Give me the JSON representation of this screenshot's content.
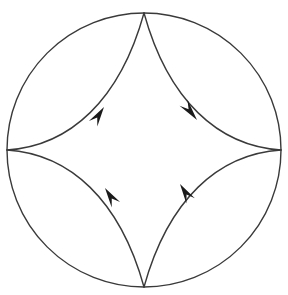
{
  "figure": {
    "background_color": "#ffffff",
    "stroke_color": "#3a3a3a",
    "arrow_color": "#1a1a1a",
    "circle_stroke_width": 1.4,
    "astroid_stroke_width": 1.4,
    "canvas": {
      "width": 288,
      "height": 295
    }
  },
  "circle": {
    "name": "boundary-circle",
    "center_x": 144,
    "center_y": 150,
    "radius": 137,
    "stroke": "#3a3a3a",
    "stroke_width": 1.4
  },
  "astroid": {
    "name": "inscribed-astroid",
    "cusps": [
      {
        "label": "top-cusp",
        "x": 144,
        "y": 13
      },
      {
        "label": "right-cusp",
        "x": 281,
        "y": 150
      },
      {
        "label": "bottom-cusp",
        "x": 144,
        "y": 287
      },
      {
        "label": "left-cusp",
        "x": 7,
        "y": 150
      }
    ],
    "arcs": [
      {
        "label": "upper-left-arc",
        "from": "left-cusp",
        "to": "top-cusp",
        "path": "M 7 150 C 70 146 120 100 144 13"
      },
      {
        "label": "upper-right-arc",
        "from": "top-cusp",
        "to": "right-cusp",
        "path": "M 144 13 C 168 100 218 146 281 150"
      },
      {
        "label": "lower-right-arc",
        "from": "right-cusp",
        "to": "bottom-cusp",
        "path": "M 281 150 C 218 154 168 200 144 287"
      },
      {
        "label": "lower-left-arc",
        "from": "bottom-cusp",
        "to": "left-cusp",
        "path": "M 144 287 C 120 200 70 154 7 150"
      }
    ]
  },
  "arrows": [
    {
      "name": "arrow-upper-left",
      "quadrant": "upper-left",
      "tip_x": 104,
      "tip_y": 107,
      "angle_deg": -57,
      "direction": "up-right",
      "length": 20,
      "half_width": 5,
      "color": "#1a1a1a"
    },
    {
      "name": "arrow-upper-right",
      "quadrant": "upper-right",
      "tip_x": 197,
      "tip_y": 120,
      "angle_deg": 52,
      "direction": "down-right",
      "length": 22,
      "half_width": 5,
      "color": "#1a1a1a"
    },
    {
      "name": "arrow-lower-left",
      "quadrant": "lower-left",
      "tip_x": 105,
      "tip_y": 188,
      "angle_deg": -123,
      "direction": "up-left",
      "length": 20,
      "half_width": 5,
      "color": "#1a1a1a"
    },
    {
      "name": "arrow-lower-right",
      "quadrant": "lower-right",
      "tip_x": 180,
      "tip_y": 184,
      "angle_deg": -122,
      "direction": "up-left",
      "length": 20,
      "half_width": 5,
      "color": "#1a1a1a"
    }
  ]
}
